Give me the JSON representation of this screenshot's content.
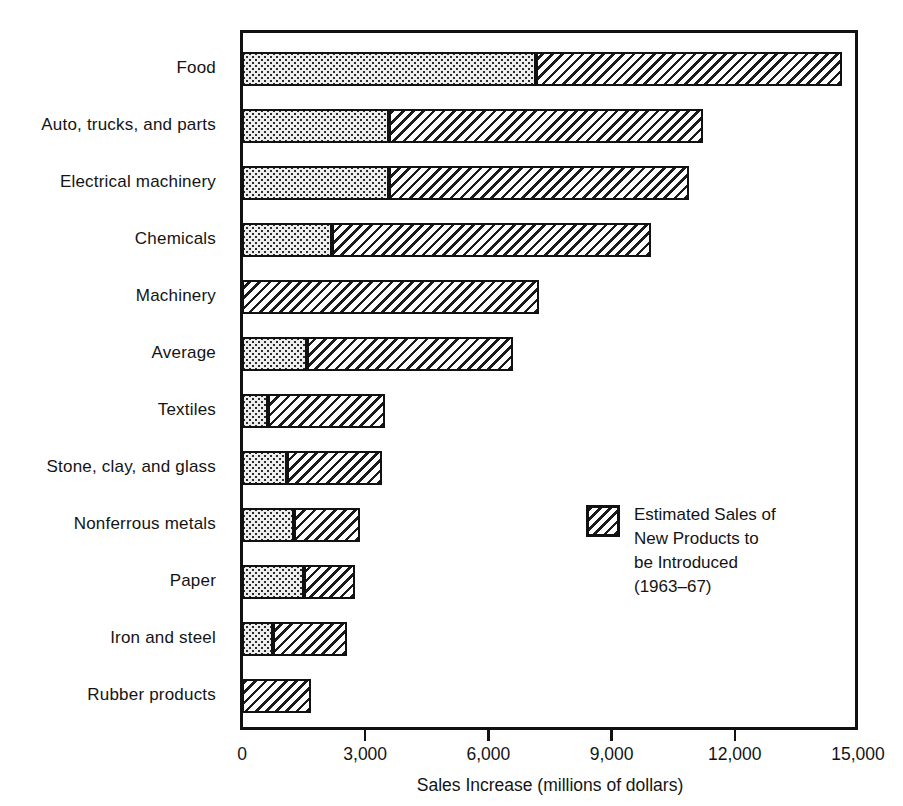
{
  "chart_data": {
    "type": "bar",
    "orientation": "horizontal",
    "stacked": true,
    "title": "",
    "xlabel": "Sales Increase (millions of dollars)",
    "ylabel": "",
    "xlim": [
      0,
      15000
    ],
    "xticks": [
      0,
      3000,
      6000,
      9000,
      12000,
      15000
    ],
    "xtick_labels": [
      "0",
      "3,000",
      "6,000",
      "9,000",
      "12,000",
      "15,000"
    ],
    "grid": false,
    "legend_position": "inside-right",
    "categories": [
      "Food",
      "Auto, trucks, and parts",
      "Electrical machinery",
      "Chemicals",
      "Machinery",
      "Average",
      "Textiles",
      "Stone, clay, and glass",
      "Nonferrous metals",
      "Paper",
      "Iron and steel",
      "Rubber products"
    ],
    "series": [
      {
        "name": "Existing Products",
        "style": "dotted",
        "values": [
          7150,
          3580,
          3580,
          2190,
          0,
          1580,
          630,
          1100,
          1270,
          1510,
          760,
          0
        ]
      },
      {
        "name": "Estimated Sales of New Products to be Introduced (1963-67)",
        "style": "diagonal-hatch",
        "values": [
          7450,
          7640,
          7300,
          7770,
          7230,
          5020,
          2850,
          2300,
          1600,
          1240,
          1800,
          1680
        ]
      }
    ],
    "totals": [
      14600,
      11220,
      10880,
      9960,
      7230,
      6600,
      3480,
      3400,
      2870,
      2750,
      2560,
      1680
    ]
  },
  "legend": {
    "swatch_style": "diagonal-hatch",
    "lines": [
      "Estimated Sales of",
      "New Products to",
      "be Introduced",
      "(1963–67)"
    ]
  }
}
